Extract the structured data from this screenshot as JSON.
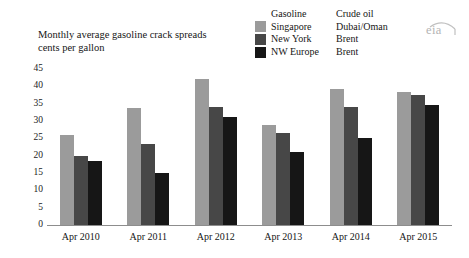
{
  "title": {
    "line1": "Monthly average gasoline crack spreads",
    "line2": "cents per gallon"
  },
  "legend": {
    "header_gasoline": "Gasoline",
    "header_crude": "Crude oil",
    "rows": [
      {
        "gasoline": "Singapore",
        "crude": "Dubai/Oman",
        "color": "#9b9b9b"
      },
      {
        "gasoline": "New York",
        "crude": "Brent",
        "color": "#474747"
      },
      {
        "gasoline": "NW Europe",
        "crude": "Brent",
        "color": "#161616"
      }
    ]
  },
  "logo": {
    "text": "eia"
  },
  "colors": {
    "series_singapore": "#9b9b9b",
    "series_new_york": "#474747",
    "series_nw_europe": "#161616",
    "axis": "#8d8d8d",
    "text": "#161616"
  },
  "chart_data": {
    "type": "bar",
    "title": "Monthly average gasoline crack spreads",
    "subtitle": "cents per gallon",
    "xlabel": "",
    "ylabel": "cents per gallon",
    "ylim": [
      0,
      45
    ],
    "yticks": [
      0,
      5,
      10,
      15,
      20,
      25,
      30,
      35,
      40,
      45
    ],
    "grid": false,
    "legend_position": "top-right",
    "categories": [
      "Apr 2010",
      "Apr 2011",
      "Apr 2012",
      "Apr 2013",
      "Apr 2014",
      "Apr 2015"
    ],
    "series": [
      {
        "name": "Singapore",
        "crude_benchmark": "Dubai/Oman",
        "color": "#9b9b9b",
        "values": [
          26.0,
          33.7,
          42.1,
          28.9,
          39.1,
          38.4
        ]
      },
      {
        "name": "New York",
        "crude_benchmark": "Brent",
        "color": "#474747",
        "values": [
          20.0,
          23.3,
          34.0,
          26.5,
          34.1,
          37.6
        ]
      },
      {
        "name": "NW Europe",
        "crude_benchmark": "Brent",
        "color": "#161616",
        "values": [
          18.6,
          15.0,
          31.3,
          21.2,
          25.0,
          34.7
        ]
      }
    ]
  }
}
